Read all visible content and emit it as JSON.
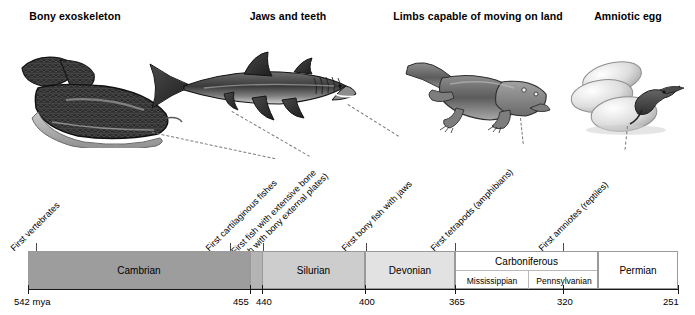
{
  "figure": {
    "type": "evolutionary-timeline",
    "time_unit": "mya",
    "axis_start_label": "542 mya",
    "axis_range_mya": [
      542,
      251
    ]
  },
  "headings": [
    {
      "label": "Bony exoskeleton",
      "x": 75
    },
    {
      "label": "Jaws and teeth",
      "x": 288
    },
    {
      "label": "Limbs capable of moving on land",
      "x": 478
    },
    {
      "label": "Amniotic egg",
      "x": 628
    }
  ],
  "illustrations": [
    {
      "name": "armored-jawless-fish",
      "caption": "Bony exoskeleton"
    },
    {
      "name": "shark",
      "caption": "Jaws and teeth"
    },
    {
      "name": "tetrapod-amphibian",
      "caption": "Limbs capable of moving on land"
    },
    {
      "name": "amniotic-eggs",
      "caption": "Amniotic egg"
    }
  ],
  "events": [
    {
      "label": "First vertebrates",
      "label2": "",
      "tick_x": 36
    },
    {
      "label": "First cartilaginous fishes",
      "label2": "",
      "tick_x": 230
    },
    {
      "label": "First fish with extensive bone",
      "label2": "(fish with bony external plates)",
      "tick_x": 263
    },
    {
      "label": "First bony fish with jaws",
      "label2": "",
      "tick_x": 366
    },
    {
      "label": "First tetrapods (amphibians)",
      "label2": "",
      "tick_x": 455
    },
    {
      "label": "First amniotes (reptiles)",
      "label2": "",
      "tick_x": 563
    }
  ],
  "periods": [
    {
      "name": "Cambrian",
      "start_mya": 542,
      "end_mya": 488,
      "color": "#9d9d9d",
      "subperiods": []
    },
    {
      "name": "Ordovician",
      "start_mya": 488,
      "end_mya": 444,
      "color": "#b4b4b4",
      "subperiods": []
    },
    {
      "name": "Silurian",
      "start_mya": 444,
      "end_mya": 416,
      "color": "#cdcdcd",
      "subperiods": []
    },
    {
      "name": "Devonian",
      "start_mya": 416,
      "end_mya": 359,
      "color": "#e2e2e2",
      "subperiods": []
    },
    {
      "name": "Carboniferous",
      "start_mya": 359,
      "end_mya": 299,
      "color": "#ffffff",
      "subperiods": [
        {
          "name": "Mississippian"
        },
        {
          "name": "Pennsylvanian"
        }
      ]
    },
    {
      "name": "Permian",
      "start_mya": 299,
      "end_mya": 251,
      "color": "#ffffff",
      "subperiods": []
    }
  ],
  "axis_ticks": [
    {
      "value": "542 mya",
      "x": 28,
      "align": "left"
    },
    {
      "value": "455",
      "x": 250,
      "align": "right"
    },
    {
      "value": "440",
      "x": 262,
      "align": "left"
    },
    {
      "value": "400",
      "x": 365,
      "align": "center"
    },
    {
      "value": "365",
      "x": 455,
      "align": "center"
    },
    {
      "value": "320",
      "x": 563,
      "align": "center"
    },
    {
      "value": "251",
      "x": 678,
      "align": "right"
    }
  ]
}
